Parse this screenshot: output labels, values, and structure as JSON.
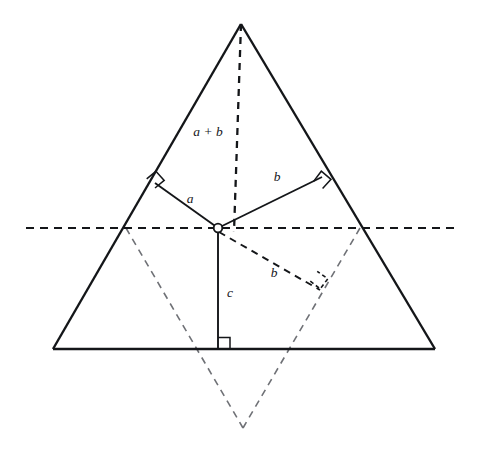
{
  "figure": {
    "background_color": "#ffffff",
    "stroke_color": "#141619",
    "reflected_stroke_color": "#6f7176",
    "labels": {
      "inradius_left": "a",
      "inradius_right_upper": "b",
      "exradius_lower": "b",
      "altitude_to_base": "c",
      "apex_altitude": "a + b"
    },
    "points": {
      "apex": {
        "x": 241,
        "y": 24
      },
      "base_left": {
        "x": 53,
        "y": 349
      },
      "base_right": {
        "x": 435,
        "y": 349
      },
      "incenter": {
        "x": 218,
        "y": 228
      },
      "tangent_left": {
        "x": 155,
        "y": 183
      },
      "tangent_right": {
        "x": 322,
        "y": 177
      },
      "foot_on_base": {
        "x": 218,
        "y": 349
      },
      "left_horizon_intersection": {
        "x": 126,
        "y": 228
      },
      "right_horizon_intersection": {
        "x": 360,
        "y": 228
      },
      "reflected_apex": {
        "x": 243,
        "y": 428
      },
      "exradius_foot": {
        "x": 318,
        "y": 288
      },
      "horizon_left_end": {
        "x": 26,
        "y": 228
      },
      "horizon_right_end": {
        "x": 458,
        "y": 228
      }
    },
    "segments": [
      {
        "name": "triangle-left-side",
        "style": "solid"
      },
      {
        "name": "triangle-right-side",
        "style": "solid"
      },
      {
        "name": "triangle-base",
        "style": "solid"
      },
      {
        "name": "inradius-to-left-side",
        "style": "solid"
      },
      {
        "name": "inradius-to-right-side",
        "style": "solid"
      },
      {
        "name": "altitude-from-incenter-to-base",
        "style": "solid"
      },
      {
        "name": "altitude-from-apex",
        "style": "dashed"
      },
      {
        "name": "exradius-to-reflected-side",
        "style": "dashed"
      },
      {
        "name": "reflected-left-side",
        "style": "dashed-light"
      },
      {
        "name": "reflected-right-side",
        "style": "dashed-light"
      },
      {
        "name": "horizontal-through-incenter",
        "style": "dashed"
      }
    ],
    "right_angle_markers": [
      {
        "name": "right-angle-left-tangent",
        "style": "solid"
      },
      {
        "name": "right-angle-right-tangent",
        "style": "solid"
      },
      {
        "name": "right-angle-base-foot",
        "style": "solid"
      },
      {
        "name": "right-angle-exradius-foot",
        "style": "dashed"
      }
    ]
  }
}
